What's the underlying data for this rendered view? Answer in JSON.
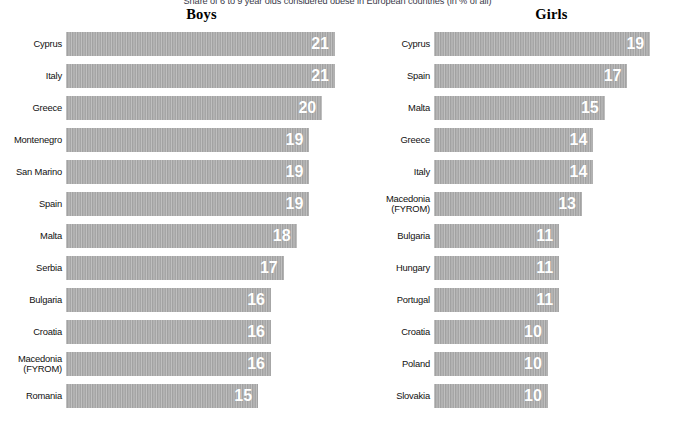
{
  "chart_data": {
    "type": "bar",
    "title": "Share of 6 to 9 year olds considered obese in European countries (in % of all)",
    "xlabel": "",
    "ylabel": "",
    "xlim": [
      0,
      21
    ],
    "grid": false,
    "legend": "none",
    "orientation": "horizontal",
    "value_suffix": "%",
    "panels": [
      {
        "name": "boys",
        "title": "Boys",
        "categories": [
          "Cyprus",
          "Italy",
          "Greece",
          "Montenegro",
          "San Marino",
          "Spain",
          "Malta",
          "Serbia",
          "Bulgaria",
          "Croatia",
          "Macedonia\n(FYROM)",
          "Romania"
        ],
        "values": [
          21,
          21,
          20,
          19,
          19,
          19,
          18,
          17,
          16,
          16,
          16,
          15
        ]
      },
      {
        "name": "girls",
        "title": "Girls",
        "categories": [
          "Cyprus",
          "Spain",
          "Malta",
          "Greece",
          "Italy",
          "Macedonia\n(FYROM)",
          "Bulgaria",
          "Hungary",
          "Portugal",
          "Croatia",
          "Poland",
          "Slovakia"
        ],
        "values": [
          19,
          17,
          15,
          14,
          14,
          13,
          11,
          11,
          11,
          10,
          10,
          10
        ]
      }
    ]
  },
  "style": {
    "bar_color": "#a9a9a9",
    "value_label_color": "#ffffff",
    "category_label_color": "#111111",
    "background": "#ffffff"
  }
}
